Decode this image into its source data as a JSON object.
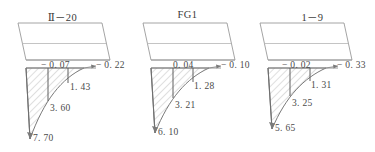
{
  "figure": {
    "background_color": "#ffffff",
    "line_color": "#8c8c8c",
    "hatch_color": "#b0b0b0",
    "text_color": "#4a4a4a",
    "panels": [
      {
        "title": "Ⅱ－20",
        "labels": {
          "top_inner": "− 0. 07",
          "top_outer": "− 0. 22",
          "level_1": "1. 43",
          "level_2": "3. 60",
          "level_3": "7. 70"
        },
        "values": {
          "top_inner": -0.07,
          "top_outer": -0.22,
          "level_1": 1.43,
          "level_2": 3.6,
          "level_3": 7.7
        }
      },
      {
        "title": "FG1",
        "labels": {
          "top_inner": "0. 04",
          "top_outer": "− 0. 10",
          "level_1": "1. 28",
          "level_2": "3. 21",
          "level_3": "6. 10"
        },
        "values": {
          "top_inner": 0.04,
          "top_outer": -0.1,
          "level_1": 1.28,
          "level_2": 3.21,
          "level_3": 6.1
        }
      },
      {
        "title": "1－9",
        "labels": {
          "top_inner": "− 0. 02",
          "top_outer": "− 0. 33",
          "level_1": "1. 31",
          "level_2": "3. 25",
          "level_3": "5. 65"
        },
        "values": {
          "top_inner": -0.02,
          "top_outer": -0.33,
          "level_1": 1.31,
          "level_2": 3.25,
          "level_3": 5.65
        }
      }
    ]
  }
}
